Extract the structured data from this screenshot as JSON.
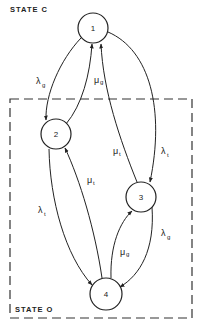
{
  "diagram": {
    "type": "state-transition",
    "regions": [
      {
        "id": "C",
        "label": "STATE C",
        "style": "none"
      },
      {
        "id": "O",
        "label": "STATE O",
        "style": "dashed-box"
      }
    ],
    "nodes": [
      {
        "id": "1",
        "label": "1",
        "region": "C"
      },
      {
        "id": "2",
        "label": "2",
        "region": "O"
      },
      {
        "id": "3",
        "label": "3",
        "region": "O"
      },
      {
        "id": "4",
        "label": "4",
        "region": "O"
      }
    ],
    "edges": [
      {
        "from": "1",
        "to": "2",
        "symbol": "λ",
        "sub": "g"
      },
      {
        "from": "2",
        "to": "1",
        "symbol": "μ",
        "sub": "g"
      },
      {
        "from": "3",
        "to": "1",
        "symbol": "μ",
        "sub": "t"
      },
      {
        "from": "1",
        "to": "3",
        "symbol": "λ",
        "sub": "t"
      },
      {
        "from": "2",
        "to": "4",
        "symbol": "λ",
        "sub": "t"
      },
      {
        "from": "4",
        "to": "2",
        "symbol": "μ",
        "sub": "t"
      },
      {
        "from": "4",
        "to": "3",
        "symbol": "μ",
        "sub": "g"
      },
      {
        "from": "3",
        "to": "4",
        "symbol": "λ",
        "sub": "g"
      }
    ]
  }
}
